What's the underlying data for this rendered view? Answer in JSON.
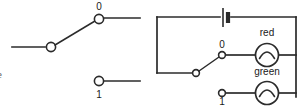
{
  "figure": {
    "kind": "electrical-schematic",
    "stroke_color": "#2b2b2b",
    "background": "#ffffff",
    "label_color": "#1a1a1a"
  },
  "edge_fragment": {
    "text": "e"
  },
  "left_diagram": {
    "name": "spdt-switch-symbol",
    "labels": {
      "pos_0": "0",
      "pos_1": "1"
    },
    "icons": {
      "pole_terminal": "terminal-node-icon",
      "throw_0_terminal": "terminal-node-icon",
      "throw_1_terminal": "terminal-node-icon",
      "blade": "switch-blade-icon"
    }
  },
  "right_diagram": {
    "name": "lamp-selector-circuit",
    "labels": {
      "pos_0": "0",
      "pos_1": "1",
      "lamp_red": "red",
      "lamp_green": "green"
    },
    "icons": {
      "battery": "battery-cell-icon",
      "switch_blade": "switch-blade-icon",
      "pole_terminal": "terminal-node-icon",
      "throw_0_terminal": "terminal-node-icon",
      "throw_1_terminal": "terminal-node-icon",
      "lamp_red": "lamp-icon",
      "lamp_green": "lamp-icon"
    }
  }
}
